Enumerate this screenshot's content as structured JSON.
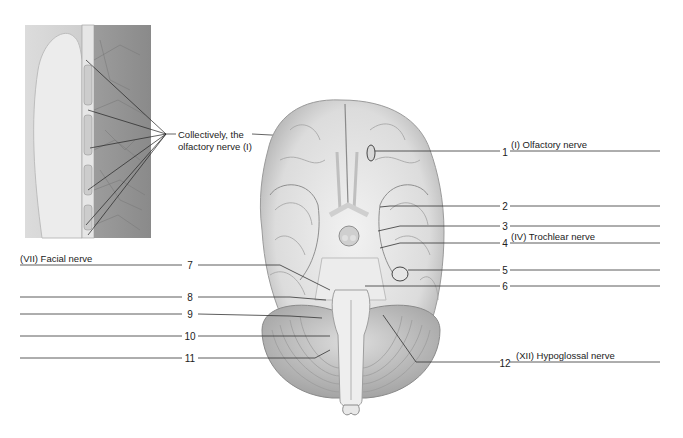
{
  "figure": {
    "inset_callout": {
      "line1": "Collectively, the",
      "line2": "olfactory nerve (I)"
    },
    "right_labels": [
      {
        "number": "1",
        "answer": "(I) Olfactory nerve"
      },
      {
        "number": "2",
        "answer": ""
      },
      {
        "number": "3",
        "answer": ""
      },
      {
        "number": "4",
        "answer": "(IV) Trochlear nerve"
      },
      {
        "number": "5",
        "answer": ""
      },
      {
        "number": "6",
        "answer": ""
      },
      {
        "number": "12",
        "answer": "(XII) Hypoglossal nerve"
      }
    ],
    "left_labels": [
      {
        "number": "7",
        "answer": "(VII) Facial nerve"
      },
      {
        "number": "8",
        "answer": ""
      },
      {
        "number": "9",
        "answer": ""
      },
      {
        "number": "10",
        "answer": ""
      },
      {
        "number": "11",
        "answer": ""
      }
    ],
    "colors": {
      "line": "#333333",
      "brain_fill": "#e4e4e4",
      "brain_shadow": "#b8b8b8",
      "inset_bg": "#cfcfcf"
    }
  }
}
